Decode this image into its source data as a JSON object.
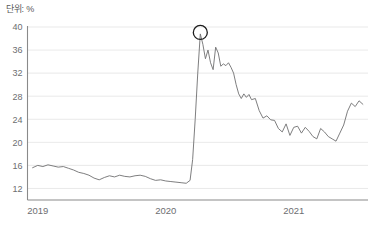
{
  "chart": {
    "unit_label": "단위: %"
  },
  "chart_data": {
    "type": "line",
    "title": "",
    "subtitle": "",
    "unit_note": "단위: %",
    "xlabel": "",
    "ylabel": "",
    "grid": true,
    "legend": null,
    "ylim": [
      10,
      40
    ],
    "yticks": [
      12,
      16,
      20,
      24,
      28,
      32,
      36,
      40
    ],
    "ytick_labels": [
      "12",
      "16",
      "20",
      "24",
      "28",
      "32",
      "36",
      "40"
    ],
    "xlim": [
      2018.92,
      2021.58
    ],
    "xticks": [
      2019,
      2020,
      2021
    ],
    "xtick_labels": [
      "2019",
      "2020",
      "2021"
    ],
    "annotations": [
      {
        "type": "circle",
        "x": 2020.27,
        "y": 38.8,
        "radius_px": 7,
        "color": "#1d1d1d",
        "note": "peak marker"
      }
    ],
    "series": [
      {
        "name": "value",
        "color": "#6f6f71",
        "x": [
          2018.96,
          2019.0,
          2019.04,
          2019.08,
          2019.12,
          2019.16,
          2019.2,
          2019.24,
          2019.28,
          2019.32,
          2019.36,
          2019.4,
          2019.44,
          2019.48,
          2019.52,
          2019.56,
          2019.6,
          2019.64,
          2019.68,
          2019.72,
          2019.76,
          2019.8,
          2019.84,
          2019.88,
          2019.92,
          2019.96,
          2020.0,
          2020.04,
          2020.08,
          2020.12,
          2020.16,
          2020.19,
          2020.21,
          2020.23,
          2020.25,
          2020.27,
          2020.29,
          2020.31,
          2020.33,
          2020.35,
          2020.37,
          2020.39,
          2020.41,
          2020.43,
          2020.45,
          2020.47,
          2020.49,
          2020.51,
          2020.53,
          2020.55,
          2020.57,
          2020.59,
          2020.61,
          2020.63,
          2020.65,
          2020.67,
          2020.7,
          2020.73,
          2020.76,
          2020.79,
          2020.82,
          2020.85,
          2020.88,
          2020.91,
          2020.94,
          2020.97,
          2021.0,
          2021.03,
          2021.06,
          2021.09,
          2021.12,
          2021.15,
          2021.18,
          2021.21,
          2021.24,
          2021.27,
          2021.3,
          2021.33,
          2021.36,
          2021.39,
          2021.42,
          2021.45,
          2021.48,
          2021.51,
          2021.54
        ],
        "y": [
          15.6,
          16.0,
          15.8,
          16.1,
          15.9,
          15.7,
          15.8,
          15.5,
          15.2,
          14.8,
          14.6,
          14.3,
          13.8,
          13.5,
          13.9,
          14.2,
          14.0,
          14.3,
          14.1,
          14.0,
          14.2,
          14.3,
          14.1,
          13.7,
          13.4,
          13.5,
          13.3,
          13.2,
          13.1,
          13.0,
          12.9,
          13.4,
          17.0,
          24.0,
          32.0,
          38.8,
          37.0,
          34.5,
          36.0,
          33.8,
          32.6,
          36.5,
          35.5,
          33.2,
          33.6,
          33.3,
          33.8,
          33.0,
          32.0,
          30.0,
          28.4,
          27.6,
          28.4,
          27.8,
          28.3,
          27.4,
          27.6,
          25.5,
          24.2,
          24.6,
          23.9,
          23.8,
          22.4,
          21.8,
          23.2,
          21.2,
          22.6,
          22.8,
          21.6,
          22.6,
          21.9,
          21.0,
          20.6,
          22.4,
          21.8,
          21.0,
          20.6,
          20.2,
          21.6,
          23.0,
          25.4,
          26.8,
          26.2,
          27.2,
          26.6
        ]
      }
    ]
  }
}
